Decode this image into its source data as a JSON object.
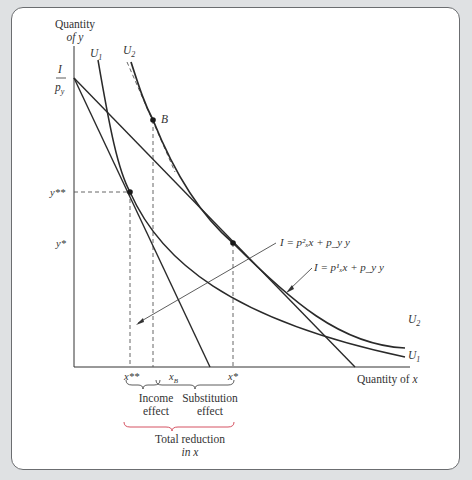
{
  "figure": {
    "y_axis_label": [
      "Quantity",
      "of y"
    ],
    "x_axis_label": "Quantity of x",
    "intercept_label": {
      "numerator": "I",
      "denominator": "p_y"
    },
    "y_ticks": {
      "y_double_star": "y**",
      "y_star": "y*"
    },
    "x_ticks": {
      "x_double_star": "x**",
      "x_B": "x_B",
      "x_star": "x*"
    },
    "curves": {
      "U1": "U1",
      "U2": "U2"
    },
    "point_B": "B",
    "budget_lines": {
      "new": "I = p²ₓx + p_y y",
      "original": "I = p¹ₓx + p_y y"
    },
    "effects": {
      "income": [
        "Income",
        "effect"
      ],
      "substitution": [
        "Substitution",
        "effect"
      ],
      "total": [
        "Total reduction",
        "in x"
      ]
    },
    "colors": {
      "line": "#2a2a2a",
      "dash": "#555555",
      "y_star_dash_left": "#b070c0",
      "y_star_dash_right": "#88d878",
      "total_brace": "#d04050",
      "background": "#dfe1e3"
    }
  }
}
